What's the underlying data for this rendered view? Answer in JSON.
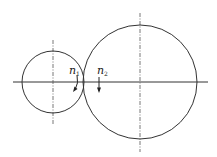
{
  "diagram": {
    "type": "gear-pair-schematic",
    "gear1": {
      "label": "n",
      "subscript": "1",
      "cx": 53,
      "cy": 82,
      "r": 31
    },
    "gear2": {
      "label": "n",
      "subscript": "2",
      "cx": 140,
      "cy": 82,
      "r": 57
    },
    "stroke_color": "#333333",
    "centerline_color": "#555555"
  }
}
